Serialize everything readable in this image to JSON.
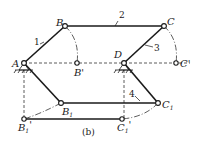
{
  "figure": {
    "caption": "(b)",
    "points": {
      "A": "A",
      "B": "B",
      "C": "C",
      "D": "D",
      "B_prime": "B'",
      "C_prime": "C'",
      "B1": "B",
      "B1_sub": "1",
      "C1": "C",
      "C1_sub": "1",
      "B1_prime": "B",
      "B1_prime_sub": "1",
      "B1_prime_mark": "'",
      "C1_prime": "C",
      "C1_prime_sub": "1",
      "C1_prime_mark": "'"
    },
    "links": {
      "link1": "1",
      "link2": "2",
      "link3": "3",
      "link4": "4"
    }
  }
}
